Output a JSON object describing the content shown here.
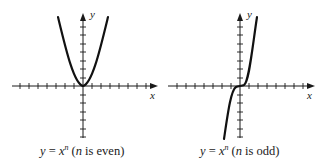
{
  "figures": [
    {
      "id": "even",
      "caption": {
        "lhs": "y",
        "eq": "=",
        "base": "x",
        "exponent": "n",
        "paren_open": "(",
        "var": "n",
        "condition": "is even",
        "paren_close": ")"
      },
      "axis_labels": {
        "x": "x",
        "y": "y"
      },
      "curve": "y = x^n, n even (U-shaped, symmetric about y-axis)"
    },
    {
      "id": "odd",
      "caption": {
        "lhs": "y",
        "eq": "=",
        "base": "x",
        "exponent": "n",
        "paren_open": "(",
        "var": "n",
        "condition": "is odd",
        "paren_close": ")"
      },
      "axis_labels": {
        "x": "x",
        "y": "y"
      },
      "curve": "y = x^n, n odd (S-shaped, symmetric about origin)"
    }
  ]
}
